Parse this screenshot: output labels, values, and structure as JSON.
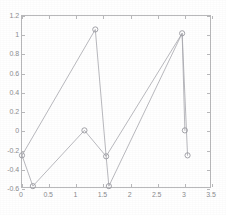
{
  "chart_data": {
    "type": "line",
    "title": "",
    "xlabel": "",
    "ylabel": "",
    "xlim": [
      0,
      3.5
    ],
    "ylim": [
      -0.6,
      1.2
    ],
    "xticks": [
      0,
      0.5,
      1,
      1.5,
      2,
      2.5,
      3,
      3.5
    ],
    "xticklabels": [
      "0",
      "0.5",
      "1",
      "1.5",
      "2",
      "2.5",
      "3",
      "3.5"
    ],
    "yticks": [
      -0.6,
      -0.4,
      -0.2,
      0,
      0.2,
      0.4,
      0.6,
      0.8,
      1,
      1.2
    ],
    "yticklabels": [
      "-0.6",
      "-0.4",
      "-0.2",
      "0",
      "0.2",
      "0.4",
      "0.6",
      "0.8",
      "1",
      "1.2"
    ],
    "grid": false,
    "legend": false,
    "marker": "circle",
    "line_color": "#a7a7ad",
    "marker_color": "#9a9aa0",
    "series": [
      {
        "name": "series-1",
        "x": [
          0,
          1.35,
          1.55,
          2.95,
          3.05
        ],
        "y": [
          -0.25,
          1.06,
          -0.26,
          1.02,
          -0.25
        ]
      },
      {
        "name": "series-2",
        "x": [
          0,
          0.2,
          1.15,
          1.55,
          1.6,
          2.95,
          3.0
        ],
        "y": [
          -0.25,
          -0.57,
          0.01,
          -0.26,
          -0.57,
          1.02,
          0.01
        ]
      }
    ],
    "points": [
      {
        "x": 0,
        "y": -0.25
      },
      {
        "x": 0.2,
        "y": -0.57
      },
      {
        "x": 1.15,
        "y": 0.01
      },
      {
        "x": 1.35,
        "y": 1.06
      },
      {
        "x": 1.55,
        "y": -0.26
      },
      {
        "x": 1.6,
        "y": -0.57
      },
      {
        "x": 2.95,
        "y": 1.02
      },
      {
        "x": 3.0,
        "y": 0.01
      },
      {
        "x": 3.05,
        "y": -0.25
      }
    ]
  }
}
